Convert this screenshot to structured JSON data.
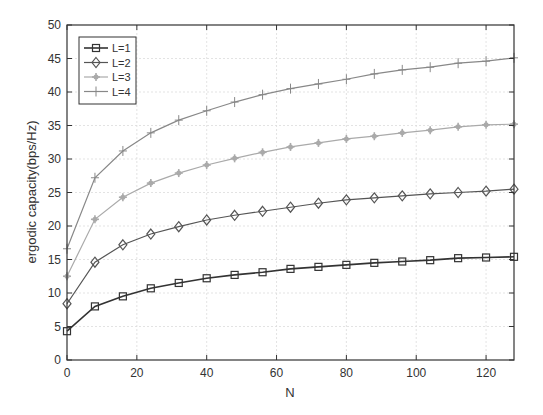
{
  "chart_data": {
    "type": "line",
    "title": "",
    "xlabel": "N",
    "ylabel": "ergodic capacity(bps/Hz)",
    "xlim": [
      0,
      128
    ],
    "ylim": [
      0,
      50
    ],
    "xticks": [
      0,
      20,
      40,
      60,
      80,
      100,
      120
    ],
    "yticks": [
      0,
      5,
      10,
      15,
      20,
      25,
      30,
      35,
      40,
      45,
      50
    ],
    "grid": true,
    "legend_position": "upper left",
    "x": [
      0,
      8,
      16,
      24,
      32,
      40,
      48,
      56,
      64,
      72,
      80,
      88,
      96,
      104,
      112,
      120,
      128
    ],
    "series": [
      {
        "name": "L=1",
        "marker": "square",
        "color": "#333333",
        "values": [
          4.3,
          8.0,
          9.5,
          10.7,
          11.5,
          12.2,
          12.7,
          13.1,
          13.6,
          13.9,
          14.2,
          14.5,
          14.7,
          14.9,
          15.2,
          15.3,
          15.4
        ]
      },
      {
        "name": "L=2",
        "marker": "diamond",
        "color": "#555555",
        "values": [
          8.4,
          14.6,
          17.2,
          18.8,
          19.9,
          20.9,
          21.6,
          22.2,
          22.8,
          23.4,
          23.9,
          24.2,
          24.5,
          24.8,
          25.0,
          25.2,
          25.5
        ]
      },
      {
        "name": "L=3",
        "marker": "asterisk",
        "color": "#aaaaaa",
        "values": [
          12.5,
          21.0,
          24.3,
          26.4,
          27.9,
          29.1,
          30.1,
          31.0,
          31.8,
          32.4,
          33.0,
          33.4,
          33.9,
          34.3,
          34.8,
          35.1,
          35.2
        ]
      },
      {
        "name": "L=4",
        "marker": "plus",
        "color": "#888888",
        "values": [
          16.6,
          27.2,
          31.2,
          33.9,
          35.8,
          37.2,
          38.5,
          39.6,
          40.5,
          41.2,
          41.9,
          42.7,
          43.3,
          43.7,
          44.3,
          44.6,
          45.1
        ]
      }
    ]
  },
  "layout": {
    "plot_left": 67,
    "plot_right": 514,
    "plot_top": 25,
    "plot_bottom": 360
  }
}
